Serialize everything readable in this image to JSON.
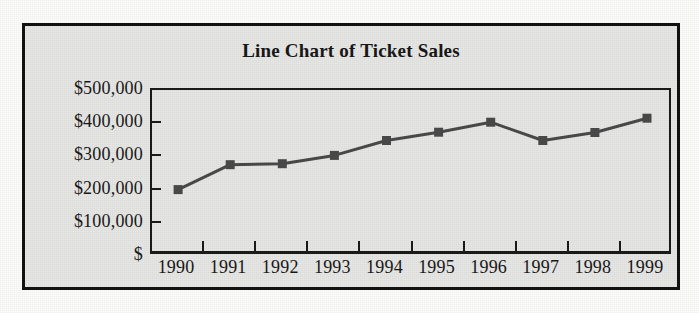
{
  "chart_data": {
    "type": "line",
    "title": "Line Chart of Ticket Sales",
    "xlabel": "",
    "ylabel": "",
    "categories": [
      "1990",
      "1991",
      "1992",
      "1993",
      "1994",
      "1995",
      "1996",
      "1997",
      "1998",
      "1999"
    ],
    "values": [
      200000,
      275000,
      278000,
      303000,
      348000,
      373000,
      403000,
      348000,
      372000,
      415000
    ],
    "series": [
      {
        "name": "Ticket Sales",
        "values": [
          200000,
          275000,
          278000,
          303000,
          348000,
          373000,
          403000,
          348000,
          372000,
          415000
        ]
      }
    ],
    "ylim": [
      0,
      500000
    ],
    "ytick_values": [
      0,
      100000,
      200000,
      300000,
      400000,
      500000
    ],
    "ytick_labels": [
      "$",
      "$100,000",
      "$200,000",
      "$300,000",
      "$400,000",
      "$500,000"
    ],
    "grid": false,
    "legend": false,
    "marker": "square",
    "line_color": "#4a4a4a",
    "marker_color": "#4a4a4a",
    "axis_color": "#1b1b1b",
    "plot_background": "#e7e7e5",
    "frame_color": "#121212"
  }
}
